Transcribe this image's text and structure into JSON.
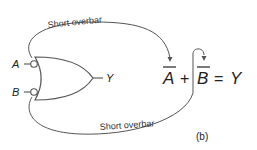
{
  "figure": {
    "caption": "(b)",
    "inputs": {
      "a": "A",
      "b": "B"
    },
    "output": "Y",
    "annotations": {
      "top": "Short overbar",
      "bottom": "Short overbar"
    },
    "equation": {
      "term1": "A",
      "op1": "+",
      "term2": "B",
      "op2": "=",
      "result": "Y"
    },
    "colors": {
      "line": "#555555",
      "text": "#222222"
    }
  }
}
